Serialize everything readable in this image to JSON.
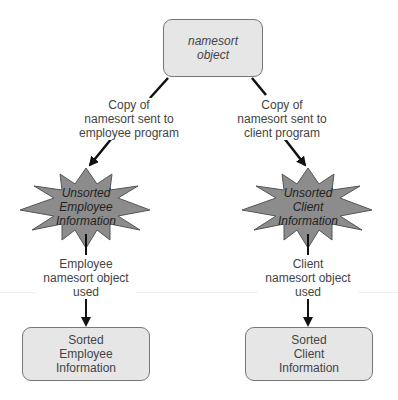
{
  "diagram": {
    "top_node": {
      "lines": [
        "namesort",
        "object"
      ]
    },
    "edges": {
      "left_copy": {
        "lines": [
          "Copy of",
          "namesort sent to",
          "employee program"
        ]
      },
      "right_copy": {
        "lines": [
          "Copy of",
          "namesort sent to",
          "client program"
        ]
      },
      "left_used": {
        "lines": [
          "Employee",
          "namesort object",
          "used"
        ]
      },
      "right_used": {
        "lines": [
          "Client",
          "namesort object",
          "used"
        ]
      }
    },
    "bursts": {
      "left": {
        "lines": [
          "Unsorted",
          "Employee",
          "Information"
        ]
      },
      "right": {
        "lines": [
          "Unsorted",
          "Client",
          "Information"
        ]
      }
    },
    "bottom_nodes": {
      "left": {
        "lines": [
          "Sorted",
          "Employee",
          "Information"
        ]
      },
      "right": {
        "lines": [
          "Sorted",
          "Client",
          "Information"
        ]
      }
    },
    "colors": {
      "box_fill": "#e6e6e6",
      "burst_fill": "#8c8c8c",
      "arrow": "#111111"
    }
  }
}
